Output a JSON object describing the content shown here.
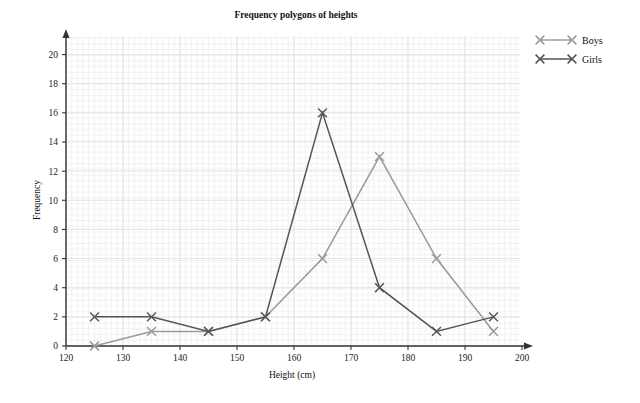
{
  "chart_data": {
    "type": "line",
    "title": "Frequency polygons of heights",
    "xlabel": "Height (cm)",
    "ylabel": "Frequency",
    "x": [
      125,
      135,
      145,
      155,
      165,
      175,
      185,
      195
    ],
    "xlim": [
      120,
      200
    ],
    "ylim": [
      0,
      21
    ],
    "xticks": [
      120,
      130,
      140,
      150,
      160,
      170,
      180,
      190,
      200
    ],
    "yticks": [
      0,
      2,
      4,
      6,
      8,
      10,
      12,
      14,
      16,
      18,
      20
    ],
    "xtick_labels": [
      "120",
      "130",
      "140",
      "150",
      "160",
      "170",
      "180",
      "190",
      "200"
    ],
    "ytick_labels": [
      "0",
      "2",
      "4",
      "6",
      "8",
      "10",
      "12",
      "14",
      "16",
      "18",
      "20"
    ],
    "grid": true,
    "legend_position": "top-right",
    "marker": "x",
    "series": [
      {
        "name": "Boys",
        "color": "#9a9a9a",
        "values": [
          0,
          1,
          1,
          2,
          6,
          13,
          6,
          1
        ]
      },
      {
        "name": "Girls",
        "color": "#555555",
        "values": [
          2,
          2,
          1,
          2,
          16,
          4,
          1,
          2
        ]
      }
    ]
  },
  "legend": {
    "items": [
      {
        "label": "Boys",
        "color": "#9a9a9a"
      },
      {
        "label": "Girls",
        "color": "#555555"
      }
    ]
  },
  "style": {
    "axis_color": "#333333",
    "grid_minor_color": "#f1f1f4",
    "grid_major_color": "#e3e3e9",
    "background": "#ffffff"
  }
}
